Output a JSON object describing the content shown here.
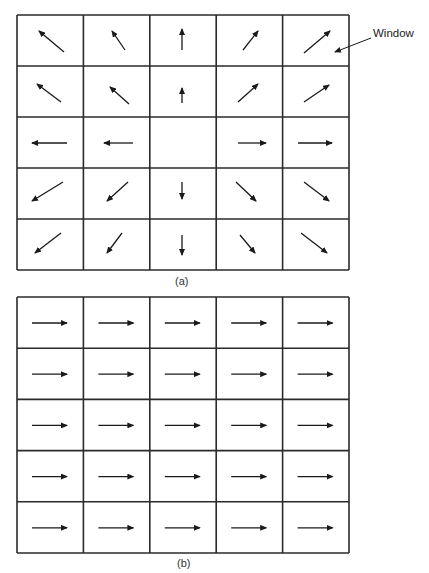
{
  "figure": {
    "panels": [
      {
        "id": "a",
        "caption": "(a)",
        "grid": {
          "x": 17,
          "y": 15,
          "cols": 5,
          "rows": 5,
          "cell_w": 66.4,
          "cell_h": 51
        },
        "arrows": [
          [
            {
              "x1": 64,
              "y1": 52,
              "x2": 39,
              "y2": 31
            },
            {
              "x1": 125,
              "y1": 50,
              "x2": 112,
              "y2": 31
            },
            {
              "x1": 182,
              "y1": 50,
              "x2": 182,
              "y2": 29
            },
            {
              "x1": 243,
              "y1": 50,
              "x2": 258,
              "y2": 31
            },
            {
              "x1": 304,
              "y1": 53,
              "x2": 330,
              "y2": 31
            }
          ],
          [
            {
              "x1": 61,
              "y1": 102,
              "x2": 37,
              "y2": 84
            },
            {
              "x1": 129,
              "y1": 104,
              "x2": 110,
              "y2": 87
            },
            {
              "x1": 182,
              "y1": 103,
              "x2": 182,
              "y2": 88
            },
            {
              "x1": 238,
              "y1": 102,
              "x2": 258,
              "y2": 84
            },
            {
              "x1": 304,
              "y1": 102,
              "x2": 329,
              "y2": 85
            }
          ],
          [
            {
              "x1": 67,
              "y1": 143,
              "x2": 32,
              "y2": 143
            },
            {
              "x1": 133,
              "y1": 143,
              "x2": 104,
              "y2": 143
            },
            null,
            {
              "x1": 238,
              "y1": 143,
              "x2": 266,
              "y2": 143
            },
            {
              "x1": 298,
              "y1": 143,
              "x2": 332,
              "y2": 143
            }
          ],
          [
            {
              "x1": 63,
              "y1": 182,
              "x2": 32,
              "y2": 201
            },
            {
              "x1": 128,
              "y1": 182,
              "x2": 107,
              "y2": 201
            },
            {
              "x1": 182,
              "y1": 182,
              "x2": 182,
              "y2": 199
            },
            {
              "x1": 236,
              "y1": 182,
              "x2": 256,
              "y2": 201
            },
            {
              "x1": 304,
              "y1": 182,
              "x2": 329,
              "y2": 201
            }
          ],
          [
            {
              "x1": 61,
              "y1": 233,
              "x2": 35,
              "y2": 253
            },
            {
              "x1": 122,
              "y1": 233,
              "x2": 107,
              "y2": 253
            },
            {
              "x1": 182,
              "y1": 235,
              "x2": 182,
              "y2": 255
            },
            {
              "x1": 240,
              "y1": 235,
              "x2": 255,
              "y2": 253
            },
            {
              "x1": 301,
              "y1": 233,
              "x2": 327,
              "y2": 253
            }
          ]
        ]
      },
      {
        "id": "b",
        "caption": "(b)",
        "grid": {
          "x": 17,
          "y": 297,
          "cols": 5,
          "rows": 5,
          "cell_w": 66.4,
          "cell_h": 51.2
        },
        "arrows_uniform": {
          "dx": 35,
          "dy": 0,
          "offset_x_in_cell": 15,
          "offset_y_in_cell": 26
        }
      }
    ],
    "annotation": {
      "text": "Window",
      "leader": {
        "x1": 371,
        "y1": 38,
        "x2": 335,
        "y2": 52
      }
    },
    "colors": {
      "line": "#2a2a2a",
      "arrow": "#1a1a1a",
      "background": "#ffffff"
    }
  }
}
